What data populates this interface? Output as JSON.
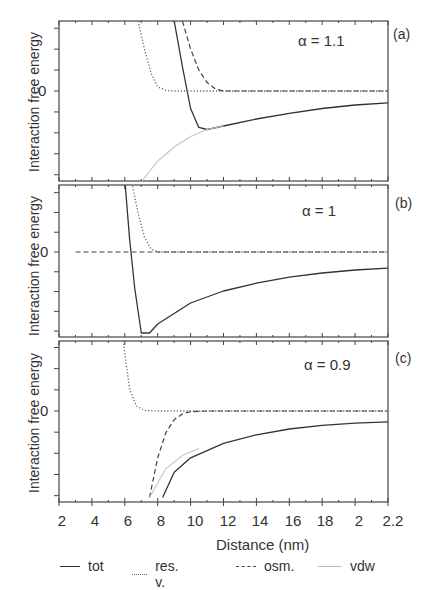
{
  "figure": {
    "ylabel": "Interaction free energy",
    "xlabel": "Distance (nm)",
    "zero_tick": "0",
    "xticks": [
      "2",
      "4",
      "6",
      "8",
      "10",
      "12",
      "14",
      "16",
      "18",
      "2",
      "2.2"
    ],
    "panels": [
      {
        "letter": "(a)",
        "alpha": "α = 1.1"
      },
      {
        "letter": "(b)",
        "alpha": "α = 1"
      },
      {
        "letter": "(c)",
        "alpha": "α = 0.9"
      }
    ],
    "legend": [
      {
        "label": "tot",
        "style": "solid",
        "color": "#333333"
      },
      {
        "label": "res. v.",
        "style": "dotted",
        "color": "#555555"
      },
      {
        "label": "osm.",
        "style": "dashed",
        "color": "#444444"
      },
      {
        "label": "vdw",
        "style": "solid-light",
        "color": "#bbbbbb"
      }
    ]
  },
  "chart_data": [
    {
      "type": "line",
      "title": "(a) α = 1.1",
      "xlabel": "Distance (nm)",
      "ylabel": "Interaction free energy",
      "xlim": [
        2,
        22
      ],
      "ylim_relative": "arbitrary units, 0 marked",
      "series": [
        {
          "name": "tot",
          "x": [
            9.0,
            9.5,
            10.0,
            10.5,
            11.0,
            12.0,
            14.0,
            16.0,
            18.0,
            20.0,
            22.0
          ],
          "y": [
            1.0,
            0.35,
            -0.25,
            -0.52,
            -0.55,
            -0.5,
            -0.4,
            -0.32,
            -0.25,
            -0.2,
            -0.17
          ]
        },
        {
          "name": "res. v.",
          "x": [
            6.8,
            7.2,
            7.6,
            8.0,
            8.5,
            9.0,
            22.0
          ],
          "y": [
            1.0,
            0.6,
            0.25,
            0.06,
            0.01,
            0.0,
            0.0
          ]
        },
        {
          "name": "osm.",
          "x": [
            9.5,
            10.0,
            10.5,
            11.0,
            11.5,
            12.0,
            22.0
          ],
          "y": [
            1.0,
            0.6,
            0.3,
            0.12,
            0.03,
            0.0,
            0.0
          ]
        },
        {
          "name": "vdw",
          "x": [
            7.0,
            8.0,
            9.0,
            10.0,
            11.0,
            12.0
          ],
          "y": [
            -1.3,
            -1.0,
            -0.8,
            -0.65,
            -0.55,
            -0.5
          ]
        }
      ]
    },
    {
      "type": "line",
      "title": "(b) α = 1",
      "xlabel": "Distance (nm)",
      "ylabel": "Interaction free energy",
      "xlim": [
        2,
        22
      ],
      "series": [
        {
          "name": "tot",
          "x": [
            6.0,
            6.3,
            6.6,
            7.0,
            7.5,
            8.0,
            10.0,
            12.0,
            14.0,
            16.0,
            18.0,
            20.0,
            22.0
          ],
          "y": [
            1.2,
            0.2,
            -0.6,
            -1.35,
            -1.35,
            -1.2,
            -0.85,
            -0.65,
            -0.52,
            -0.42,
            -0.35,
            -0.3,
            -0.27
          ]
        },
        {
          "name": "res. v.",
          "x": [
            6.4,
            6.8,
            7.2,
            7.6,
            8.0,
            22.0
          ],
          "y": [
            1.2,
            0.65,
            0.25,
            0.05,
            0.0,
            0.0
          ]
        },
        {
          "name": "osm.",
          "x": [
            3.0,
            22.0
          ],
          "y": [
            0.0,
            0.0
          ]
        }
      ]
    },
    {
      "type": "line",
      "title": "(c) α = 0.9",
      "xlabel": "Distance (nm)",
      "ylabel": "Interaction free energy",
      "xlim": [
        2,
        22
      ],
      "series": [
        {
          "name": "tot",
          "x": [
            8.3,
            9.0,
            10.0,
            11.0,
            12.0,
            14.0,
            16.0,
            18.0,
            20.0,
            22.0
          ],
          "y": [
            -1.2,
            -0.85,
            -0.65,
            -0.55,
            -0.45,
            -0.33,
            -0.25,
            -0.2,
            -0.17,
            -0.15
          ]
        },
        {
          "name": "res. v.",
          "x": [
            5.8,
            6.0,
            6.3,
            6.7,
            7.2,
            8.0,
            22.0
          ],
          "y": [
            1.2,
            0.8,
            0.3,
            0.07,
            0.01,
            0.0,
            0.0
          ]
        },
        {
          "name": "osm.",
          "x": [
            7.5,
            8.0,
            8.5,
            9.0,
            9.5,
            10.0,
            11.0,
            22.0
          ],
          "y": [
            -1.2,
            -0.65,
            -0.3,
            -0.12,
            -0.04,
            -0.01,
            0.0,
            0.0
          ]
        },
        {
          "name": "vdw",
          "x": [
            7.5,
            8.5,
            9.5,
            10.5
          ],
          "y": [
            -1.2,
            -0.8,
            -0.62,
            -0.52
          ]
        }
      ]
    }
  ]
}
